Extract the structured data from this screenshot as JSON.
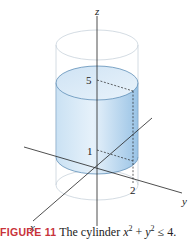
{
  "figure": {
    "number_label": "FIGURE 11",
    "caption_text": "The cylinder ",
    "caption_math": {
      "x": "x",
      "x_exp": "2",
      "plus": " + ",
      "y": "y",
      "y_exp": "2",
      "rel": " ≤ 4."
    }
  },
  "axes": {
    "x_label": "x",
    "y_label": "y",
    "z_label": "z"
  },
  "ticks": {
    "z_upper": "5",
    "z_lower": "1",
    "y_tick": "2"
  },
  "colors": {
    "cylinder_fill_top": "#d6e8f6",
    "cylinder_fill_side": "#a9cdea",
    "cylinder_edge": "#5f8fb8",
    "ghost_cylinder": "#c9d3dc",
    "axis": "#222222",
    "caption_accent": "#c8333a"
  }
}
